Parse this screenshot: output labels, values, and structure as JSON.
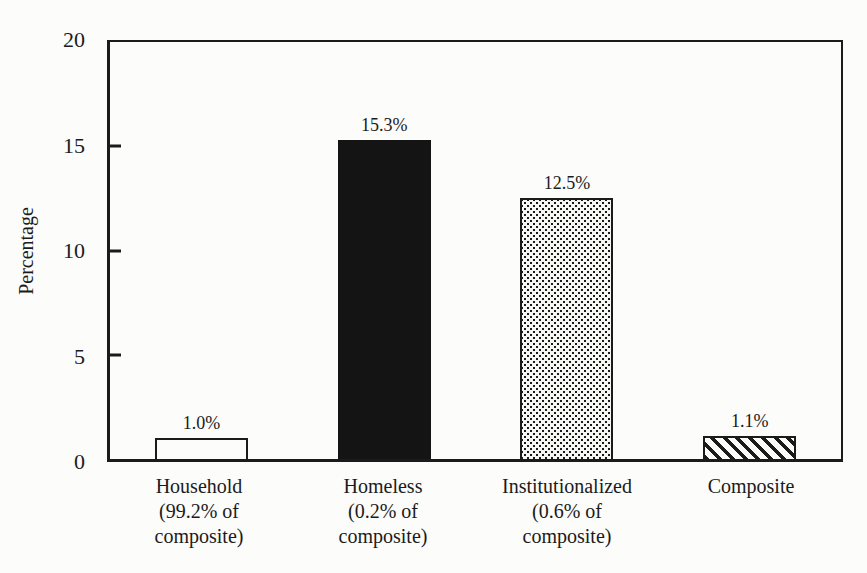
{
  "chart_data": {
    "type": "bar",
    "title": "",
    "xlabel": "",
    "ylabel": "Percentage",
    "ylim": [
      0,
      20
    ],
    "yticks": [
      0,
      5,
      10,
      15,
      20
    ],
    "grid": false,
    "legend": "none",
    "categories": [
      "Household",
      "Homeless",
      "Institutionalized",
      "Composite"
    ],
    "category_label_lines": [
      [
        "Household",
        "(99.2% of",
        "composite)"
      ],
      [
        "Homeless",
        "(0.2% of",
        "composite)"
      ],
      [
        "Institutionalized",
        "(0.6% of",
        "composite)"
      ],
      [
        "Composite"
      ]
    ],
    "values": [
      1.0,
      15.3,
      12.5,
      1.1
    ],
    "value_labels": [
      "1.0%",
      "15.3%",
      "12.5%",
      "1.1%"
    ],
    "bar_styles": [
      "outline",
      "solid",
      "dots",
      "hatch"
    ],
    "bar_style_descriptions": [
      "white fill with black outline",
      "solid black fill",
      "stippled dot pattern",
      "diagonal backslash hatch pattern"
    ],
    "colors": {
      "ink": "#1b1b1b",
      "paper": "#fcfcfa"
    }
  }
}
